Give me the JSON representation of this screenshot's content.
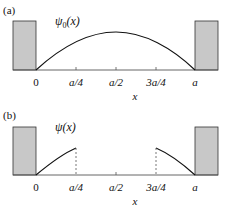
{
  "colors": {
    "wall_fill": "#c8c8c8",
    "wall_stroke": "#333333",
    "curve": "#111111",
    "axis": "#555555"
  },
  "panels": [
    {
      "label": "(a)",
      "function_name": "ψ",
      "function_sub": "0",
      "function_arg": "(x)",
      "x_axis_label": "x",
      "ticks": [
        "0",
        "a/4",
        "a/2",
        "3a/4",
        "a"
      ],
      "curve": "half-sine from 0 to a"
    },
    {
      "label": "(b)",
      "function_name": "ψ",
      "function_sub": "",
      "function_arg": "(x)",
      "x_axis_label": "x",
      "ticks": [
        "0",
        "a/4",
        "a/2",
        "3a/4",
        "a"
      ],
      "curve": "sine segments on [0, a/4] and [3a/4, a], zero in between"
    }
  ]
}
